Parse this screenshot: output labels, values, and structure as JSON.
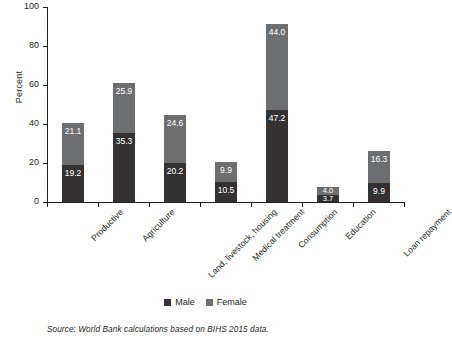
{
  "chart_data": {
    "type": "bar",
    "subtype": "stacked-vertical",
    "title": "",
    "xlabel": "",
    "ylabel": "Percent",
    "ylim": [
      0,
      100
    ],
    "yticks": [
      0,
      20,
      40,
      60,
      80,
      100
    ],
    "ytick_labels": [
      "0",
      "20",
      "40",
      "60",
      "80",
      "100"
    ],
    "grid": false,
    "legend_position": "bottom-center",
    "categories": [
      "Productive",
      "Agriculture",
      "Land, livestock, housing",
      "Medical treatment",
      "Consumption",
      "Education",
      "Loan repayment"
    ],
    "series": [
      {
        "name": "Male",
        "color": "#333132",
        "values": [
          19.2,
          35.3,
          20.2,
          10.5,
          47.2,
          3.7,
          9.9
        ],
        "labels": [
          "19.2",
          "35.3",
          "20.2",
          "10.5",
          "47.2",
          "3.7",
          "9.9"
        ]
      },
      {
        "name": "Female",
        "color": "#6d6e70",
        "values": [
          21.1,
          25.9,
          24.6,
          9.9,
          44.0,
          4.0,
          16.3
        ],
        "labels": [
          "21.1",
          "25.9",
          "24.6",
          "9.9",
          "44.0",
          "4.0",
          "16.3"
        ]
      }
    ],
    "totals": [
      40.3,
      61.2,
      44.8,
      20.4,
      91.2,
      7.7,
      26.2
    ]
  },
  "legend": {
    "items": [
      {
        "label": "Male",
        "swatch": "male-swatch"
      },
      {
        "label": "Female",
        "swatch": "female-swatch"
      }
    ]
  },
  "source": {
    "text": "Source: World Bank calculations based on BIHS 2015 data."
  },
  "colors": {
    "male": "#333132",
    "female": "#6d6e70",
    "axis": "#231f20",
    "background": "#ffffff",
    "label_text": "#ffffff"
  }
}
